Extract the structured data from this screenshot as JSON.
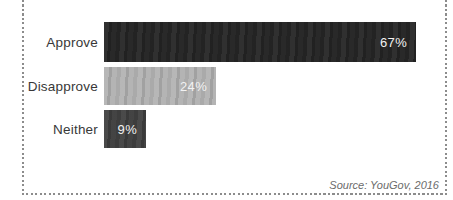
{
  "page": {
    "background": "#ffffff",
    "border_color": "#8c8c8c"
  },
  "chart_data": {
    "type": "bar",
    "orientation": "horizontal",
    "title": "",
    "xlabel": "",
    "ylabel": "",
    "categories": [
      "Approve",
      "Disapprove",
      "Neither"
    ],
    "values": [
      67,
      24,
      9
    ],
    "value_labels": [
      "67%",
      "24%",
      "9%"
    ],
    "bar_colors": [
      "#252525",
      "#b3b3b3",
      "#404040"
    ],
    "category_label_color": "#383838",
    "value_label_color": "#f2f2f2",
    "xlim": [
      0,
      100
    ],
    "grid": false,
    "legend": false,
    "source": "Source: YouGov, 2016"
  }
}
